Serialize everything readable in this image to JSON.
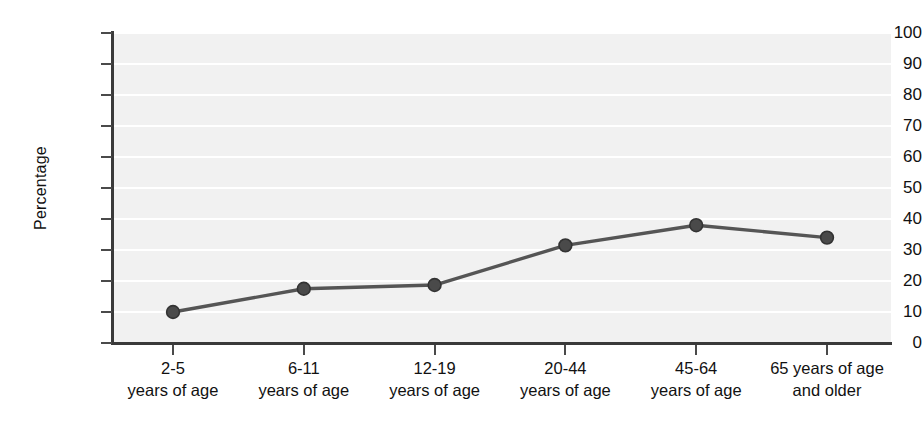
{
  "chart_data": {
    "type": "line",
    "title": "",
    "subtitle": "",
    "xlabel": "",
    "ylabel": "Percentage",
    "categories": [
      "2-5 years of age",
      "6-11 years of age",
      "12-19 years of age",
      "20-44 years of age",
      "45-64 years of age",
      "65 years of age and older"
    ],
    "category_lines": [
      [
        "2-5",
        "years of age"
      ],
      [
        "6-11",
        "years of age"
      ],
      [
        "12-19",
        "years of age"
      ],
      [
        "20-44",
        "years of age"
      ],
      [
        "45-64",
        "years of age"
      ],
      [
        "65 years of age",
        "and older"
      ]
    ],
    "values": [
      10,
      17.5,
      18.7,
      31.5,
      38,
      34
    ],
    "ylim": [
      0,
      100
    ],
    "yticks": [
      0,
      10,
      20,
      30,
      40,
      50,
      60,
      70,
      80,
      90,
      100
    ],
    "ytick_labels": [
      "0",
      "10",
      "20",
      "30",
      "40",
      "50",
      "60",
      "70",
      "80",
      "90",
      "100"
    ],
    "grid": "horizontal",
    "legend": "none",
    "series": [
      {
        "name": "Percentage",
        "values": [
          10,
          17.5,
          18.7,
          31.5,
          38,
          34
        ],
        "line_color": "#555555",
        "marker_color": "#4a4a4a",
        "marker_edge_color": "#333333",
        "marker": "circle"
      }
    ],
    "colors": {
      "plot_background": "#f1f1f1",
      "gridline": "#ffffff",
      "axis": "#3a3a3a",
      "text": "#111111",
      "page_background": "#ffffff"
    }
  }
}
